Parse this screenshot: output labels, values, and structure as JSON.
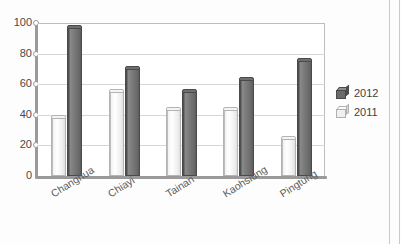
{
  "chart_data": {
    "type": "bar",
    "title": "",
    "subtitle": "",
    "xlabel": "",
    "ylabel": "",
    "categories": [
      "Changhua",
      "Chiayi",
      "Tainan",
      "Kaohsiung",
      "Pingtung"
    ],
    "series": [
      {
        "name": "2012",
        "color": "#6b6b6b",
        "values": [
          97,
          70,
          55,
          63,
          75
        ]
      },
      {
        "name": "2011",
        "color": "#ededed",
        "values": [
          38,
          55,
          43,
          43,
          24
        ]
      }
    ],
    "series_draw_order": [
      "2011",
      "2012"
    ],
    "ylim": [
      0,
      100
    ],
    "ytick_labels": [
      "0",
      "20",
      "40",
      "60",
      "80",
      "100"
    ],
    "ytick_values": [
      0,
      20,
      40,
      60,
      80,
      100
    ],
    "grid": "horizontal",
    "legend_position": "right",
    "legend_entries": [
      {
        "label": "2012",
        "color": "#6b6b6b"
      },
      {
        "label": "2011",
        "color": "#ededed"
      }
    ]
  }
}
